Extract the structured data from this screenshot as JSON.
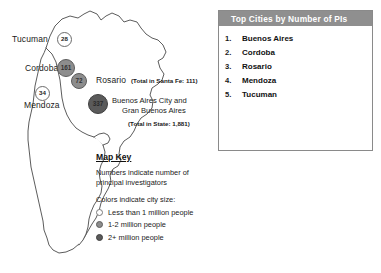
{
  "map": {
    "region_name": "Argentina",
    "cities": [
      {
        "name": "Tucuman",
        "pi_count": "28",
        "size_class": "size-small",
        "label_left": "12px",
        "label_top": "34px",
        "marker_left": "57px",
        "marker_top": "32px",
        "marker_size": "15px",
        "font_size": "6.2px"
      },
      {
        "name": "Cordoba",
        "pi_count": "161",
        "size_class": "size-mid",
        "label_left": "25px",
        "label_top": "63px",
        "marker_left": "57px",
        "marker_top": "59px",
        "marker_size": "18px",
        "font_size": "6.4px"
      },
      {
        "name": "Rosario",
        "pi_count": "72",
        "size_class": "size-mid",
        "label_left": "96px",
        "label_top": "75px",
        "marker_left": "71px",
        "marker_top": "73px",
        "marker_size": "16px",
        "font_size": "6.3px"
      },
      {
        "name": "Mendoza",
        "pi_count": "34",
        "size_class": "size-small",
        "label_left": "24px",
        "label_top": "100px",
        "marker_left": "35px",
        "marker_top": "86px",
        "marker_size": "15px",
        "font_size": "6.2px"
      }
    ],
    "buenos_aires": {
      "pi_count": "337",
      "size_class": "size-large",
      "marker_left": "88px",
      "marker_top": "94px",
      "marker_size": "20px",
      "font_size": "6.4px",
      "label_line1": "Buenos Aires City and",
      "label_line2": "Gran Buenos Aires",
      "total_note": "(Total in State: 1,881)"
    },
    "annotations": {
      "rosario_total": "(Total in Santa Fe: 111)"
    }
  },
  "panel": {
    "header": "Top Cities by Number of PIs",
    "rows": [
      {
        "rank": "1.",
        "city": "Buenos Aires"
      },
      {
        "rank": "2.",
        "city": "Cordoba"
      },
      {
        "rank": "3.",
        "city": "Rosario"
      },
      {
        "rank": "4.",
        "city": "Mendoza"
      },
      {
        "rank": "5.",
        "city": "Tucuman"
      }
    ]
  },
  "map_key": {
    "title": "Map Key",
    "note_line1": "Numbers indicate number of",
    "note_line2": "principal investigators",
    "subhead": "Colors indicate city size:",
    "items": [
      {
        "label": "Less than 1 million people",
        "swatch": "sw-small"
      },
      {
        "label": "1-2 million people",
        "swatch": "sw-mid"
      },
      {
        "label": "2+ million people",
        "swatch": "sw-large"
      }
    ]
  },
  "colors": {
    "panel_header_bg": "#8f8f8f",
    "map_stroke": "#4a4a4a",
    "marker_small": "#ffffff",
    "marker_mid": "#8d8d8d",
    "marker_large": "#5a5a5a"
  }
}
